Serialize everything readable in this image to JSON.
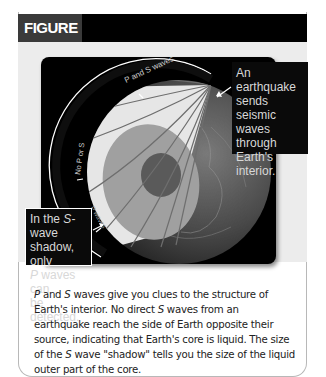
{
  "figure": {
    "label": "FIGURE 6-2",
    "colors": {
      "header_bar": "#000000",
      "label_bg": "#3a3a3a",
      "figure_area_bg": "#ececec",
      "panel_bg": "#000000",
      "shadow_zone": "#e6e6e6",
      "mantle": "#a0a0a0",
      "outer_core": "#8a8a8a",
      "inner_core": "#5a5a5a"
    },
    "diagram": {
      "ring_labels": {
        "p_and_s": "P and S waves",
        "no_p_or_s": "No P or S",
        "p_only": "P waves"
      },
      "callouts": {
        "top": {
          "lines": [
            "An earthquake",
            "sends seismic",
            "waves through",
            "Earth's interior."
          ]
        },
        "bottom": {
          "line1_prefix": "In the ",
          "line1_italic": "S",
          "line1_suffix": "-wave",
          "line2": "shadow, only",
          "line3_italic": "P",
          "line3_suffix": " waves can",
          "line4": "be detected."
        }
      }
    },
    "caption": {
      "s1_italic_p": "P",
      "s1_mid": " and ",
      "s1_italic_s": "S",
      "s1_rest": " waves give you clues to the structure of Earth's interior. No direct ",
      "s2_italic_s": "S",
      "s2_rest": " waves from an earthquake reach the side of Earth opposite their source, indicating that Earth's core is liquid. The size of the ",
      "s3_italic_s": "S",
      "s3_rest": " wave \"shadow\" tells you the size of the liquid outer part of the core."
    }
  }
}
